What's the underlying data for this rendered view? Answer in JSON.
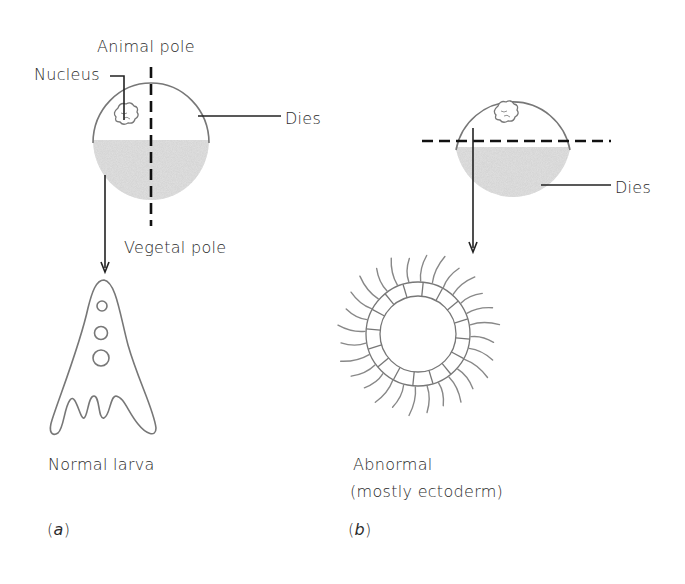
{
  "figure": {
    "panel_a": {
      "label": "(a)",
      "labels": {
        "animal_pole": "Animal pole",
        "nucleus": "Nucleus",
        "dies": "Dies",
        "vegetal_pole": "Vegetal pole",
        "result": "Normal larva"
      },
      "cut": "vertical (animal–vegetal axis)"
    },
    "panel_b": {
      "label": "(b)",
      "labels": {
        "dies": "Dies",
        "result_line1": "Abnormal",
        "result_line2": "(mostly ectoderm)"
      },
      "cut": "horizontal (equatorial)"
    },
    "colors": {
      "outline": "#777777",
      "text": "#2b2b2b",
      "yolk_shading": "#d9d9d9",
      "cut_line": "#111111"
    }
  }
}
